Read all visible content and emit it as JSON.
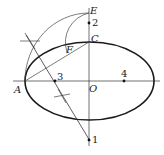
{
  "figure": {
    "labels": {
      "E": "E",
      "C": "C",
      "F": "F",
      "A": "A",
      "O": "O",
      "p1": "1",
      "p2": "2",
      "p3": "3",
      "p4": "4"
    },
    "colors": {
      "stroke": "#222222",
      "ellipse": "#1a1a1a",
      "background": "#ffffff"
    }
  }
}
